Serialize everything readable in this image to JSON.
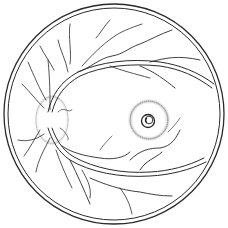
{
  "illustration": {
    "subject": "Retinal fundus line drawing",
    "structures": [
      "optic-disc",
      "retinal-vessels",
      "macula-lesion",
      "fundus-border"
    ],
    "colors": {
      "line": "#2a2a2a",
      "stipple": "#888888",
      "background": "#ffffff"
    }
  }
}
